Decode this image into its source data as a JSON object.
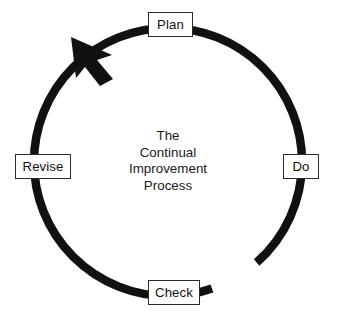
{
  "diagram": {
    "title": "The Continual Improvement Process",
    "type": "cycle",
    "direction": "counterclockwise",
    "background_color": "#ffffff",
    "stroke_color": "#111111",
    "box_border_color": "#2b2b2b",
    "box_fill_color": "#ffffff",
    "center_label": {
      "line1": "The",
      "line2": "Continual",
      "line3": "Improvement",
      "line4": "Process"
    },
    "nodes": [
      {
        "id": "plan",
        "label": "Plan",
        "position": "top"
      },
      {
        "id": "do",
        "label": "Do",
        "position": "right"
      },
      {
        "id": "check",
        "label": "Check",
        "position": "bottom"
      },
      {
        "id": "revise",
        "label": "Revise",
        "position": "left"
      }
    ],
    "arrow": {
      "name": "cycle-direction-arrowhead",
      "position": "upper-left",
      "points_toward": "plan"
    }
  }
}
